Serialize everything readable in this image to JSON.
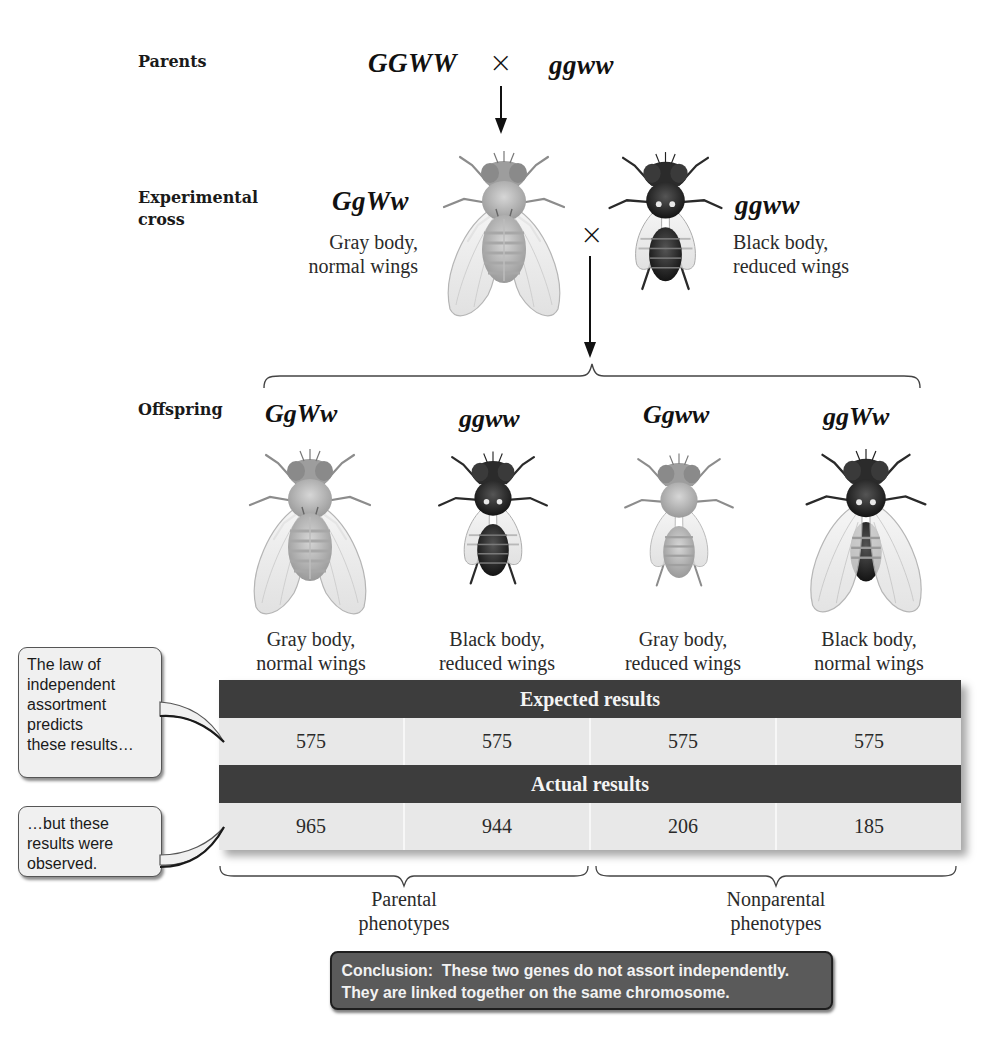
{
  "parents": {
    "label": "Parents",
    "genotype_left": "GGWW",
    "cross_symbol": "×",
    "genotype_right": "ggww"
  },
  "experimental_cross": {
    "label_line1": "Experimental",
    "label_line2": "cross",
    "left": {
      "genotype": "GgWw",
      "phenotype_line1": "Gray body,",
      "phenotype_line2": "normal wings",
      "fly_icon": "gray-fly-normal-wings"
    },
    "cross_symbol": "×",
    "right": {
      "genotype": "ggww",
      "phenotype_line1": "Black body,",
      "phenotype_line2": "reduced wings",
      "fly_icon": "black-fly-reduced-wings"
    }
  },
  "offspring": {
    "label": "Offspring",
    "items": [
      {
        "genotype": "GgWw",
        "phenotype_line1": "Gray body,",
        "phenotype_line2": "normal wings",
        "fly_icon": "gray-fly-normal-wings"
      },
      {
        "genotype": "ggww",
        "phenotype_line1": "Black body,",
        "phenotype_line2": "reduced wings",
        "fly_icon": "black-fly-reduced-wings"
      },
      {
        "genotype": "Ggww",
        "phenotype_line1": "Gray body,",
        "phenotype_line2": "reduced wings",
        "fly_icon": "gray-fly-reduced-wings"
      },
      {
        "genotype": "ggWw",
        "phenotype_line1": "Black body,",
        "phenotype_line2": "normal wings",
        "fly_icon": "black-fly-normal-wings"
      }
    ]
  },
  "results_table": {
    "expected_header": "Expected results",
    "expected": [
      "575",
      "575",
      "575",
      "575"
    ],
    "actual_header": "Actual results",
    "actual": [
      "965",
      "944",
      "206",
      "185"
    ],
    "colors": {
      "header_bg": "#3d3d3d",
      "cell_bg": "#e8e8e8"
    }
  },
  "callouts": {
    "expected_lines": [
      "The law of",
      "independent",
      "assortment",
      "predicts",
      "these results…"
    ],
    "actual_lines": [
      "…but these",
      "results were",
      "observed."
    ]
  },
  "groups": {
    "parental_line1": "Parental",
    "parental_line2": "phenotypes",
    "nonparental_line1": "Nonparental",
    "nonparental_line2": "phenotypes"
  },
  "conclusion": {
    "line1": "Conclusion:  These two genes do not assort independently.",
    "line2": "They are linked together on the same chromosome.",
    "bg_color": "#5a5a5a"
  }
}
